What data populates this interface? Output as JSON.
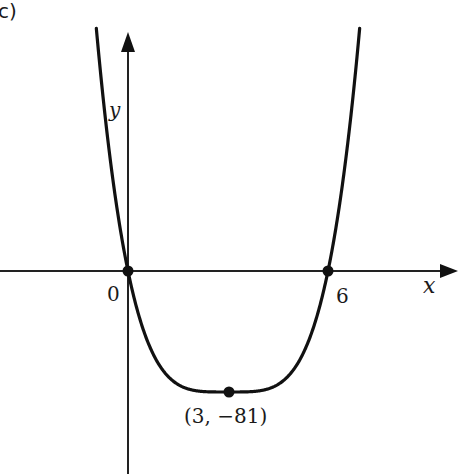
{
  "part_label": "c)",
  "chart_data": {
    "type": "line",
    "title": "",
    "function": "y = (x - 3)^4 - 81",
    "xlabel": "x",
    "ylabel": "y",
    "tick_labels": {
      "origin": "0",
      "x_intercept": "6"
    },
    "points": [
      {
        "x": 0,
        "y": 0,
        "label": "0"
      },
      {
        "x": 6,
        "y": 0,
        "label": "6"
      },
      {
        "x": 3,
        "y": -81,
        "label": "(3, −81)"
      }
    ],
    "series": [
      {
        "name": "curve",
        "x": [
          -0.94,
          -0.5,
          0,
          0.5,
          1,
          1.5,
          2,
          2.5,
          3,
          3.5,
          4,
          4.5,
          5,
          5.5,
          6,
          6.5,
          6.96
        ],
        "values": [
          160,
          69,
          0,
          -42,
          -65,
          -76,
          -80,
          -81,
          -81,
          -81,
          -80,
          -76,
          -65,
          -42,
          0,
          69,
          160
        ]
      }
    ],
    "grid": false,
    "legend": null
  },
  "axes": {
    "x_label": "x",
    "y_label": "y"
  },
  "labels": {
    "origin": "0",
    "six": "6",
    "minimum": "(3, −81)"
  }
}
